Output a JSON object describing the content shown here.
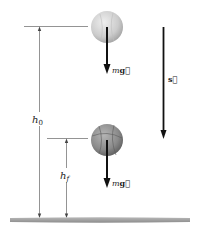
{
  "diagram": {
    "title": "",
    "colors": {
      "line": "#555555",
      "arrow": "#111111",
      "ground": "#9a9a9a",
      "ball_top": "#cfcfcf",
      "ball_bottom": "#8a8a8a"
    },
    "labels": {
      "h0_main": "h",
      "h0_sub": "0",
      "hf_main": "h",
      "hf_sub": "f",
      "force_top_m": "m",
      "force_top_g": "g⃗",
      "force_bottom_m": "m",
      "force_bottom_g": "g⃗",
      "displacement": "s⃗"
    },
    "elements": [
      {
        "name": "ball-top",
        "description": "ball at initial height"
      },
      {
        "name": "ball-bottom",
        "description": "basketball at final height"
      },
      {
        "name": "ground",
        "description": "ground surface"
      }
    ]
  }
}
